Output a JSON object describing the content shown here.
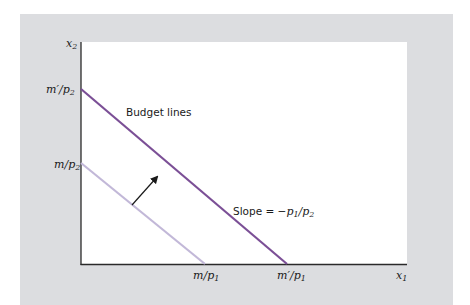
{
  "figure": {
    "type": "budget-line-shift",
    "colors": {
      "background_panel": "#dcdde0",
      "plot_area": "#ffffff",
      "outer_budget_line": "#7b4f96",
      "inner_budget_line": "#c2b8d8",
      "axis": "#2a2a2a",
      "arrow": "#1a1a1a"
    },
    "axes": {
      "x_label": "x",
      "x_label_sub": "1",
      "y_label": "x",
      "y_label_sub": "2"
    },
    "y_ticks": [
      {
        "text": "m′/p",
        "sub": "2"
      },
      {
        "text": "m/p",
        "sub": "2"
      }
    ],
    "x_ticks": [
      {
        "text": "m/p",
        "sub": "1"
      },
      {
        "text": "m′/p",
        "sub": "1"
      }
    ],
    "annotations": {
      "budget_lines": "Budget lines",
      "slope_prefix": "Slope = −",
      "slope_p1": "p",
      "slope_p1_sub": "1",
      "slope_sep": "/",
      "slope_p2": "p",
      "slope_p2_sub": "2"
    },
    "lines": [
      {
        "name": "inner budget line",
        "y_intercept": "m/p2",
        "x_intercept": "m/p1"
      },
      {
        "name": "outer budget line",
        "y_intercept": "m′/p2",
        "x_intercept": "m′/p1"
      }
    ],
    "arrow": "shift outward from inner to outer budget line"
  }
}
